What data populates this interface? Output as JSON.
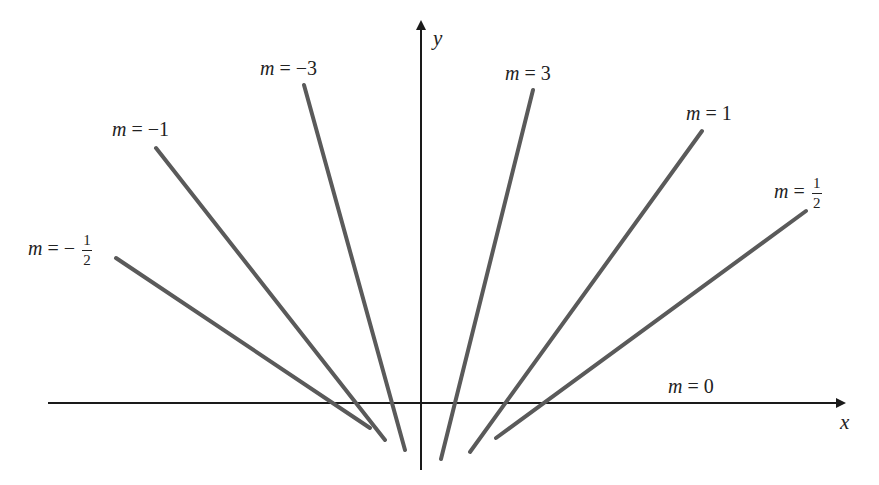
{
  "diagram": {
    "origin": {
      "x": 421,
      "y": 403
    },
    "axes": {
      "x_label": "x",
      "y_label": "y",
      "color": "#1a1a1a"
    },
    "line_color": "#5a5a5a",
    "lines": [
      {
        "id": "m-neg-half",
        "slope_label": "m = − 1/2",
        "m_text": "m",
        "eq": " = −",
        "num": "1",
        "den": "2",
        "x1": 116,
        "y1": 258,
        "x2": 370,
        "y2": 428
      },
      {
        "id": "m-neg-1",
        "slope_label": "m = −1",
        "m_text": "m",
        "eq": " = −1",
        "x1": 156,
        "y1": 148,
        "x2": 385,
        "y2": 440
      },
      {
        "id": "m-neg-3",
        "slope_label": "m = −3",
        "m_text": "m",
        "eq": " = −3",
        "x1": 304,
        "y1": 85,
        "x2": 405,
        "y2": 450
      },
      {
        "id": "m-3",
        "slope_label": "m = 3",
        "m_text": "m",
        "eq": " = 3",
        "x1": 533,
        "y1": 90,
        "x2": 441,
        "y2": 459
      },
      {
        "id": "m-1",
        "slope_label": "m = 1",
        "m_text": "m",
        "eq": " = 1",
        "x1": 702,
        "y1": 131,
        "x2": 470,
        "y2": 452
      },
      {
        "id": "m-half",
        "slope_label": "m = 1/2",
        "m_text": "m",
        "eq": " =",
        "num": "1",
        "den": "2",
        "x1": 806,
        "y1": 211,
        "x2": 496,
        "y2": 438
      },
      {
        "id": "m-0",
        "slope_label": "m = 0",
        "m_text": "m",
        "eq": " = 0"
      }
    ]
  }
}
